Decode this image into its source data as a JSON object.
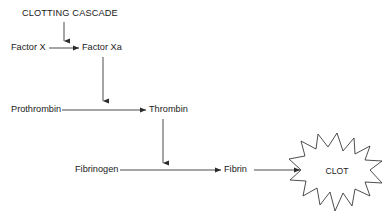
{
  "canvas": {
    "width": 388,
    "height": 219,
    "background": "#ffffff",
    "stroke_color": "#2b2b2b",
    "text_color": "#1a1a1a"
  },
  "diagram": {
    "title": "CLOTTING CASCADE",
    "type": "flowchart",
    "nodes": [
      {
        "id": "title",
        "label": "CLOTTING CASCADE",
        "x": 22,
        "y": 14,
        "shape": "text"
      },
      {
        "id": "factor_x",
        "label": "Factor X",
        "x": 11,
        "y": 48,
        "shape": "text"
      },
      {
        "id": "factor_xa",
        "label": "Factor Xa",
        "x": 82,
        "y": 48,
        "shape": "text"
      },
      {
        "id": "prothrombin",
        "label": "Prothrombin",
        "x": 11,
        "y": 110,
        "shape": "text"
      },
      {
        "id": "thrombin",
        "label": "Thrombin",
        "x": 149,
        "y": 110,
        "shape": "text"
      },
      {
        "id": "fibrinogen",
        "label": "Fibrinogen",
        "x": 75,
        "y": 170,
        "shape": "text"
      },
      {
        "id": "fibrin",
        "label": "Fibrin",
        "x": 224,
        "y": 170,
        "shape": "text"
      },
      {
        "id": "clot",
        "label": "CLOT",
        "x": 337,
        "y": 172,
        "shape": "starburst"
      }
    ],
    "edges": [
      {
        "from": "title",
        "to": "factor_x_row",
        "orientation": "vertical",
        "arrowhead": true
      },
      {
        "from": "factor_x",
        "to": "factor_xa",
        "orientation": "horizontal",
        "arrowhead": true
      },
      {
        "from": "factor_xa",
        "to": "prothrombin_row",
        "orientation": "vertical",
        "arrowhead": true
      },
      {
        "from": "prothrombin",
        "to": "thrombin",
        "orientation": "horizontal",
        "arrowhead": true
      },
      {
        "from": "thrombin",
        "to": "fibrinogen_row",
        "orientation": "vertical",
        "arrowhead": true
      },
      {
        "from": "fibrinogen",
        "to": "fibrin",
        "orientation": "horizontal",
        "arrowhead": true
      },
      {
        "from": "fibrin",
        "to": "clot",
        "orientation": "horizontal",
        "arrowhead": true
      }
    ]
  }
}
